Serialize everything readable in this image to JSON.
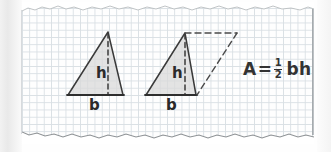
{
  "figure": {
    "medium": "hand-drawn pencil sketch on grid paper",
    "background_color": "#ffffff",
    "grid_color": "#c9d2d8",
    "ink_color": "#2e2e2e",
    "shade_color": "#d9d9d9"
  },
  "shapes": {
    "triangle_left": {
      "name": "shaded-triangle",
      "height_label": "h",
      "base_label": "b",
      "height_line_style": "dashed",
      "fill": "#d9d9d9"
    },
    "triangle_right": {
      "name": "shaded-triangle-with-parallelogram",
      "height_label": "h",
      "base_label": "b",
      "height_line_style": "dashed",
      "completion_style": "dashed",
      "fill": "#d9d9d9"
    }
  },
  "formula": {
    "left_side": "A",
    "equals": "=",
    "numerator": "1",
    "denominator": "2",
    "variables": "bh",
    "full_text": "A = 1/2 bh"
  }
}
